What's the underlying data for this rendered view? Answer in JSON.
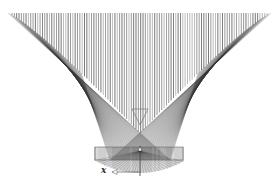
{
  "diagram": {
    "type": "ray-trace-reflector",
    "colors": {
      "background": "#ffffff",
      "ray_dark": "#3a3a3a",
      "ray_mid": "#6a6a6a",
      "ray_light": "#9a9a9a",
      "marker": "#7a7a7a"
    },
    "bundle": {
      "top_y": 13,
      "left_x": 8,
      "right_x": 271,
      "focus_x": 140,
      "focus_y": 133,
      "ray_count": 110
    },
    "reflector": {
      "rect": {
        "x": 95,
        "y": 147,
        "w": 88,
        "h": 13
      },
      "bowl_bottom_y": 173
    },
    "marker_triangle": {
      "x1": 132,
      "x2": 148,
      "top_y": 109,
      "tip_y": 125
    },
    "axis": {
      "x_label": "x",
      "label_x": 101,
      "label_y": 165,
      "arrow_from_x": 140,
      "arrow_to_x": 112,
      "arrow_y": 172,
      "vertical_x": 140,
      "vertical_top_y": 146,
      "vertical_bottom_y": 176
    }
  }
}
